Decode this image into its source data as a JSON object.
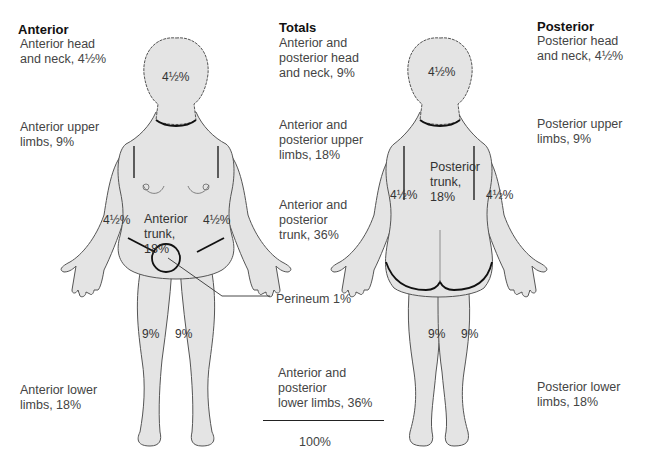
{
  "columns": {
    "anterior": {
      "heading": "Anterior",
      "head_neck": [
        "Anterior head",
        "and neck, 4½%"
      ],
      "upper_limbs": [
        "Anterior upper",
        "limbs, 9%"
      ],
      "lower_limbs": [
        "Anterior lower",
        "limbs, 18%"
      ]
    },
    "totals": {
      "heading": "Totals",
      "head_neck": [
        "Anterior and",
        "posterior head",
        "and neck, 9%"
      ],
      "upper_limbs": [
        "Anterior and",
        "posterior upper",
        "limbs, 18%"
      ],
      "trunk": [
        "Anterior and",
        "posterior",
        "trunk, 36%"
      ],
      "perineum": "Perineum 1%",
      "lower_limbs": [
        "Anterior and",
        "posterior",
        "lower limbs, 36%"
      ],
      "sum": "100%"
    },
    "posterior": {
      "heading": "Posterior",
      "head_neck": [
        "Posterior head",
        "and neck, 4½%"
      ],
      "upper_limbs": [
        "Posterior upper",
        "limbs, 9%"
      ],
      "lower_limbs": [
        "Posterior lower",
        "limbs, 18%"
      ]
    }
  },
  "figures": {
    "anterior": {
      "head": "4½%",
      "left_arm": "4½%",
      "right_arm": "4½%",
      "trunk": [
        "Anterior",
        "trunk,",
        "18%"
      ],
      "left_leg": "9%",
      "right_leg": "9%"
    },
    "posterior": {
      "head": "4½%",
      "left_arm": "4½%",
      "right_arm": "4½%",
      "trunk": [
        "Posterior",
        "trunk,",
        "18%"
      ],
      "left_leg": "9%",
      "right_leg": "9%"
    }
  },
  "colors": {
    "skin_fill": "#e4e4e4",
    "outline": "#444444",
    "boundary": "#111111"
  }
}
